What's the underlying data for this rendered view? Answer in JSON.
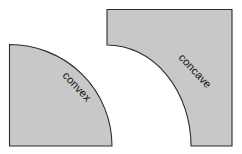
{
  "figure": {
    "background_color": "#ffffff",
    "width": 242,
    "height": 154
  },
  "style": {
    "shape_fill_color": "#c8c8c8",
    "shape_stroke_color": "#2b2b2b",
    "label_color": "#111111"
  },
  "shapes": [
    {
      "id": "convex",
      "label": "convex",
      "kind": "quarter-disc",
      "description": "Quarter disc with outward-bulging arc",
      "fill_color": "#c8c8c8",
      "stroke_color": "#2b2b2b",
      "path": "M 9.5 44.5 L 9.5 146 L 112 146 A 102.5 101.5 0 0 0 9.5 44.5 Z",
      "label_transform": "rotate(47 62 76)",
      "label_x": 62,
      "label_y": 76
    },
    {
      "id": "concave",
      "label": "concave",
      "kind": "square-minus-quarter-disc",
      "description": "Square with a quarter disc removed from the lower-left corner",
      "fill_color": "#c8c8c8",
      "stroke_color": "#2b2b2b",
      "path": "M 107 9.5 L 232 9.5 L 232 146 L 191 146 A 84 101 0 0 0 107 45 Z",
      "label_transform": "rotate(47 178 58)",
      "label_x": 178,
      "label_y": 58
    }
  ]
}
